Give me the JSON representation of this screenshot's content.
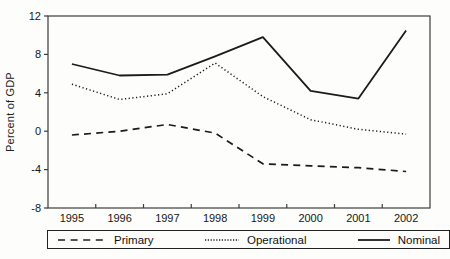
{
  "figure": {
    "ylabel": "Percent of GDP",
    "line_color": "#1b1b1b",
    "axis_color": "#3d3d3d",
    "text_color": "#161616",
    "background": "#fdfdfb"
  },
  "chart_data": {
    "type": "line",
    "title": "",
    "xlabel": "",
    "ylabel": "Percent of GDP",
    "categories": [
      "1995",
      "1996",
      "1997",
      "1998",
      "1999",
      "2000",
      "2001",
      "2002"
    ],
    "ylim": [
      -8,
      12
    ],
    "yticks": [
      12,
      8,
      4,
      0,
      -4,
      -8
    ],
    "grid": false,
    "legend_position": "bottom",
    "series": [
      {
        "name": "Primary",
        "style": "dashed",
        "values": [
          -0.4,
          0.0,
          0.7,
          -0.2,
          -3.4,
          -3.6,
          -3.8,
          -4.2
        ]
      },
      {
        "name": "Operational",
        "style": "dotted",
        "values": [
          4.9,
          3.3,
          3.9,
          7.1,
          3.6,
          1.2,
          0.2,
          -0.3
        ]
      },
      {
        "name": "Nominal",
        "style": "solid",
        "values": [
          7.0,
          5.8,
          5.9,
          7.8,
          9.8,
          4.2,
          3.4,
          10.5
        ]
      }
    ]
  },
  "legend": {
    "items": [
      {
        "label": "Primary",
        "style": "dashed"
      },
      {
        "label": "Operational",
        "style": "dotted"
      },
      {
        "label": "Nominal",
        "style": "solid"
      }
    ]
  }
}
